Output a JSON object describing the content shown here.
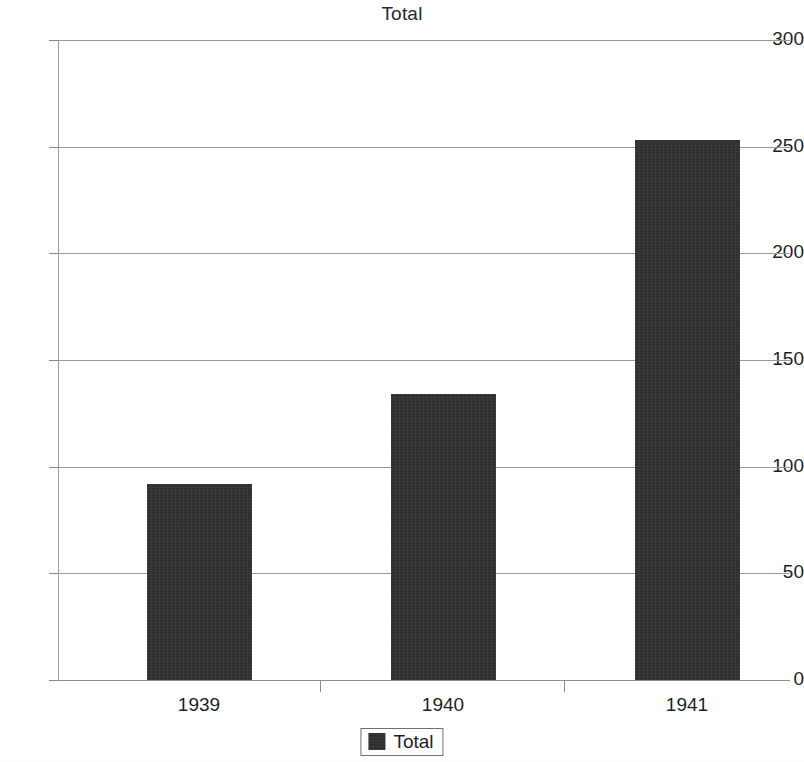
{
  "chart_data": {
    "type": "bar",
    "title": "Total",
    "xlabel": "",
    "ylabel": "",
    "categories": [
      "1939",
      "1940",
      "1941"
    ],
    "values": [
      92,
      134,
      253
    ],
    "series": [
      {
        "name": "Total",
        "values": [
          92,
          134,
          253
        ]
      }
    ],
    "ylim": [
      0,
      300
    ],
    "ytick_labels": [
      "300",
      "250",
      "200",
      "150",
      "100",
      "50",
      "0"
    ],
    "ytick_values": [
      300,
      250,
      200,
      150,
      100,
      50,
      0
    ],
    "grid": "horizontal",
    "legend": {
      "position": "bottom-center",
      "entries": [
        {
          "label": "Total",
          "color": "#2f2f2f"
        }
      ]
    },
    "bar_color": "#2f2f2f",
    "background_color": "#ffffff",
    "gridline_color": "#9b9b9b",
    "axis_color": "#9d9d9d",
    "text_color": "#1f1f1f"
  }
}
